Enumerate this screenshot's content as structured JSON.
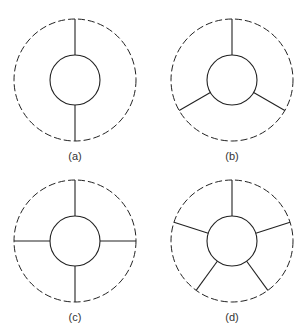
{
  "figures": [
    {
      "label": "(a)",
      "spokes": 2,
      "cx": 75,
      "cy": 80,
      "start_angle": -90
    },
    {
      "label": "(b)",
      "spokes": 3,
      "cx": 232,
      "cy": 80,
      "start_angle": -90
    },
    {
      "label": "(c)",
      "spokes": 4,
      "cx": 75,
      "cy": 241,
      "start_angle": -90
    },
    {
      "label": "(d)",
      "spokes": 5,
      "cx": 232,
      "cy": 241,
      "start_angle": -90
    }
  ],
  "geometry": {
    "outer_radius": 61,
    "inner_radius": 25,
    "label_offset": 76
  },
  "colors": {
    "stroke": "#222222",
    "label": "#333333"
  }
}
